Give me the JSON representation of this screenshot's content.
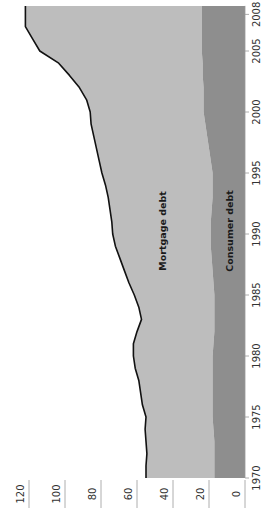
{
  "chart_data": {
    "type": "area",
    "stacked": true,
    "orientation": "rotated-90-clockwise",
    "title": "",
    "xlabel": "",
    "ylabel": "",
    "x": [
      1970,
      1971,
      1972,
      1973,
      1974,
      1975,
      1976,
      1977,
      1978,
      1979,
      1980,
      1981,
      1982,
      1983,
      1984,
      1985,
      1986,
      1987,
      1988,
      1989,
      1990,
      1991,
      1992,
      1993,
      1994,
      1995,
      1996,
      1997,
      1998,
      1999,
      2000,
      2001,
      2002,
      2003,
      2004,
      2005,
      2006,
      2007,
      2008
    ],
    "xticks": [
      1970,
      1975,
      1980,
      1985,
      1990,
      1995,
      2000,
      2005,
      2008
    ],
    "yticks": [
      0,
      20,
      40,
      60,
      80,
      100,
      120
    ],
    "ylim": [
      0,
      120
    ],
    "xlim": [
      1970,
      2008.7
    ],
    "grid": false,
    "series": [
      {
        "name": "Consumer debt",
        "color": "#8e8e8e",
        "values": [
          17,
          17,
          17,
          17,
          17.5,
          18,
          18,
          18,
          18,
          18,
          18,
          17.5,
          17,
          17,
          17,
          17,
          17.5,
          18,
          18.5,
          19,
          19,
          19,
          18.5,
          18,
          18,
          18,
          19,
          20,
          21,
          22,
          23,
          23,
          23,
          23.5,
          23.5,
          24,
          24,
          24,
          24
        ]
      },
      {
        "name": "Mortgage debt",
        "color": "#bdbdbd",
        "values": [
          38,
          38,
          37.5,
          38,
          38,
          37,
          39,
          40,
          41,
          43,
          44,
          44.5,
          43,
          40.5,
          42,
          44.5,
          47,
          49,
          51,
          53,
          54.5,
          55,
          56.5,
          58,
          59.5,
          61.5,
          62,
          62.5,
          63,
          63.5,
          63,
          65,
          69,
          74,
          80,
          90,
          94,
          98,
          98
        ]
      }
    ],
    "total_line": {
      "name": "Total household debt",
      "color": "#111111",
      "values": [
        55,
        55,
        54.5,
        55,
        55.5,
        55,
        57,
        58,
        59,
        61,
        62,
        62,
        60,
        57.5,
        59,
        61.5,
        64.5,
        67,
        69.5,
        72,
        73.5,
        74,
        75,
        76,
        77.5,
        79.5,
        81,
        82.5,
        84,
        85.5,
        86,
        88,
        92,
        97.5,
        103.5,
        114,
        118,
        122,
        122
      ]
    },
    "annotations": [
      {
        "text": "Mortgage debt",
        "x": 1990,
        "y": 46
      },
      {
        "text": "Consumer debt",
        "x": 1990,
        "y": 9
      }
    ]
  }
}
